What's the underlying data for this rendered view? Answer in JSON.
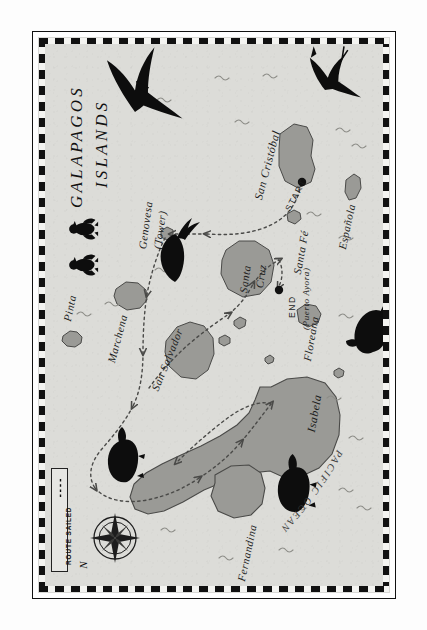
{
  "map": {
    "title": "GALAPAGOS ISLANDS",
    "title_line1": "GALAPAGOS",
    "title_line2": "ISLANDS",
    "ocean_label": "PACIFIC OCEAN",
    "orientation_note": "map rotated 90 degrees counter-clockwise",
    "colors": {
      "sea": "#dcdcd8",
      "land": "#9a9a96",
      "land_stroke": "#3c3c3a",
      "ink": "#1c1c1c",
      "route": "#5a5a58",
      "border_dark": "#111111",
      "border_light": "#f4f4f1"
    }
  },
  "legend": {
    "label": "ROUTE SAILED",
    "symbol": "dashed-line"
  },
  "compass": {
    "north_label": "N",
    "points": 8
  },
  "markers": [
    {
      "id": "start",
      "label": "START",
      "sublabel": "",
      "island": "San Cristóbal"
    },
    {
      "id": "end",
      "label": "END",
      "sublabel": "(Puerto Ayora)",
      "island": "Santa Cruz"
    }
  ],
  "islands": [
    {
      "name": "Pinta",
      "size": "small"
    },
    {
      "name": "Marchena",
      "size": "small"
    },
    {
      "name": "Genovesa (Tower)",
      "size": "small",
      "line1": "Genovesa",
      "line2": "(Tower)"
    },
    {
      "name": "San Salvador",
      "size": "medium"
    },
    {
      "name": "Santa Cruz",
      "size": "medium",
      "line1": "Santa",
      "line2": "Cruz"
    },
    {
      "name": "San Cristóbal",
      "size": "medium"
    },
    {
      "name": "Santa Fé",
      "size": "small"
    },
    {
      "name": "Española",
      "size": "small"
    },
    {
      "name": "Floreana",
      "size": "small"
    },
    {
      "name": "Isabela",
      "size": "large"
    },
    {
      "name": "Fernandina",
      "size": "medium"
    }
  ],
  "wildlife": [
    {
      "name": "frigatebird",
      "count": 1,
      "position": "upper-left-sea"
    },
    {
      "name": "booby-bird",
      "count": 1,
      "position": "upper-right-sea"
    },
    {
      "name": "penguin",
      "count": 2,
      "position": "left-edge-near-genovesa"
    },
    {
      "name": "iguana",
      "count": 1,
      "position": "centre-near-genovesa"
    },
    {
      "name": "sea-lion",
      "count": 1,
      "position": "right-of-isabela"
    },
    {
      "name": "tortoise",
      "count": 1,
      "position": "left-of-fernandina"
    },
    {
      "name": "tortoise",
      "count": 1,
      "position": "bottom-near-fernandina"
    }
  ],
  "route": {
    "description": "Dashed sailing route from START at San Cristóbal north to Genovesa, west past San Salvador, around Isabela and Fernandina, returning east to END at Santa Cruz (Puerto Ayora).",
    "style": "dashed",
    "arrows": 12
  }
}
